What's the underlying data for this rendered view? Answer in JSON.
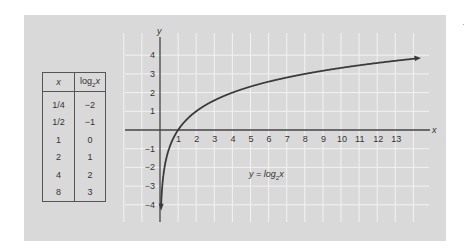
{
  "table": {
    "headers": [
      "x",
      "log2x"
    ],
    "header_x": "x",
    "header_log_base": "log",
    "header_log_sub": "2",
    "header_log_var": "x",
    "rows": [
      {
        "x": "1/4",
        "y": "−2"
      },
      {
        "x": "1/2",
        "y": "−1"
      },
      {
        "x": "1",
        "y": "0"
      },
      {
        "x": "2",
        "y": "1"
      },
      {
        "x": "4",
        "y": "2"
      },
      {
        "x": "8",
        "y": "3"
      }
    ]
  },
  "equation": {
    "lhs": "y = log",
    "sub": "2",
    "var": "x"
  },
  "axes": {
    "x_label": "x",
    "y_label": "y",
    "x_ticks": [
      "1",
      "2",
      "3",
      "4",
      "5",
      "6",
      "7",
      "8",
      "9",
      "10",
      "11",
      "12",
      "13"
    ],
    "y_ticks": [
      "4",
      "3",
      "2",
      "1",
      "−1",
      "−2",
      "−3",
      "−4"
    ]
  },
  "colors": {
    "panel": "#d9d9d9",
    "grid": "#f2f2f2",
    "curve": "#3a3a3a",
    "axis": "#444444"
  },
  "chart_data": {
    "type": "line",
    "title": "y = log2x",
    "xlabel": "x",
    "ylabel": "y",
    "xlim": [
      -2,
      15
    ],
    "ylim": [
      -4.5,
      4.5
    ],
    "grid": true,
    "series": [
      {
        "name": "y = log2x",
        "x": [
          0.0625,
          0.125,
          0.25,
          0.5,
          1,
          2,
          4,
          8,
          13.9
        ],
        "values": [
          -4,
          -3,
          -2,
          -1,
          0,
          1,
          2,
          3,
          3.8
        ]
      }
    ],
    "table": {
      "columns": [
        "x",
        "log2x"
      ],
      "rows": [
        [
          "1/4",
          -2
        ],
        [
          "1/2",
          -1
        ],
        [
          "1",
          0
        ],
        [
          "2",
          1
        ],
        [
          "4",
          2
        ],
        [
          "8",
          3
        ]
      ]
    },
    "x_ticks": [
      1,
      2,
      3,
      4,
      5,
      6,
      7,
      8,
      9,
      10,
      11,
      12,
      13
    ],
    "y_ticks": [
      -4,
      -3,
      -2,
      -1,
      1,
      2,
      3,
      4
    ],
    "annotations": [
      "y = log2x"
    ]
  }
}
